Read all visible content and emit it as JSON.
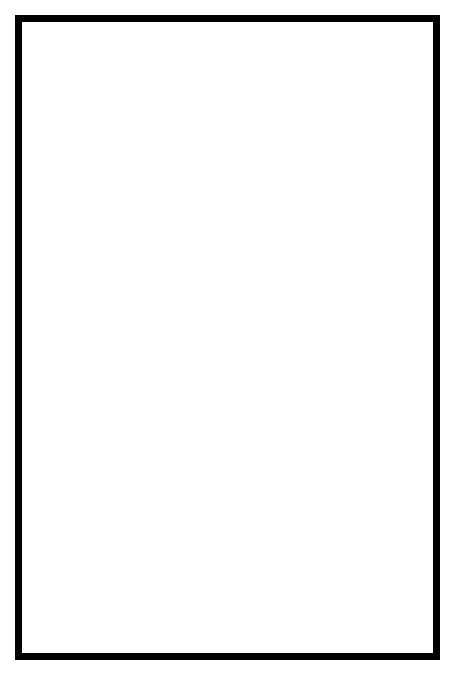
{
  "figure": {
    "domain": "scientific-illustration",
    "frame_count": 8,
    "ink_color": "#000000",
    "paper_color": "#ffffff"
  },
  "panels": [
    {
      "number": "1",
      "arrow": "down",
      "arrow_x": 52,
      "arrow_y_anchor": "below-head",
      "wave_start": 48,
      "wave_count": 3,
      "wave_amplitude": 26,
      "wave_period": 34,
      "wave_phase": "head-region-tight-coils",
      "body_baseline": 34,
      "tail_x": 412,
      "surface_y": 12
    },
    {
      "number": "2",
      "arrow": "down",
      "arrow_x": 54,
      "arrow_y_anchor": "below-head",
      "wave_start": 72,
      "wave_count": 3,
      "wave_amplitude": 28,
      "wave_period": 34,
      "wave_phase": "coils-shifted-right",
      "body_baseline": 31,
      "tail_x": 400,
      "surface_y": 13
    },
    {
      "number": "3",
      "arrow": "up",
      "arrow_x": 62,
      "arrow_y_anchor": "above-head",
      "wave_start": 112,
      "wave_count": 3,
      "wave_amplitude": 27,
      "wave_period": 30,
      "wave_phase": "mid-body-coils",
      "body_baseline": 32,
      "tail_x": 404,
      "surface_y": 12
    },
    {
      "number": "4",
      "arrow": "down",
      "arrow_x": 60,
      "arrow_y_anchor": "below-head",
      "wave_start": 140,
      "wave_count": 3,
      "wave_amplitude": 29,
      "wave_period": 30,
      "wave_phase": "coils-past-midline",
      "body_baseline": 28,
      "tail_x": 408,
      "surface_y": 11
    },
    {
      "number": "5",
      "arrow": "up",
      "arrow_x": 84,
      "arrow_y_anchor": "above-head",
      "wave_start": 62,
      "wave_count": 3,
      "wave_amplitude": 30,
      "wave_period": 46,
      "wave_phase": "broad-waves-spread",
      "body_baseline": 30,
      "tail_x": 406,
      "surface_y": 12
    },
    {
      "number": "6",
      "arrow": "down",
      "arrow_x": 72,
      "arrow_y_anchor": "below-head",
      "wave_start": 58,
      "wave_count": 3,
      "wave_amplitude": 31,
      "wave_period": 42,
      "wave_phase": "deep-loops-near-head",
      "body_baseline": 26,
      "tail_x": 410,
      "surface_y": 11
    },
    {
      "number": "7",
      "arrow": "up",
      "arrow_x": 84,
      "arrow_y_anchor": "above-head",
      "wave_start": 62,
      "wave_count": 3,
      "wave_amplitude": 27,
      "wave_period": 32,
      "wave_phase": "coils-returned-to-head",
      "body_baseline": 28,
      "tail_x": 404,
      "surface_y": 13
    },
    {
      "number": "8",
      "arrow": "none",
      "arrow_x": 0,
      "arrow_y_anchor": "none",
      "wave_start": 54,
      "wave_count": 3,
      "wave_amplitude": 26,
      "wave_period": 32,
      "wave_phase": "cycle-complete-tight-coils",
      "body_baseline": 27,
      "tail_x": 402,
      "surface_y": 12
    }
  ]
}
